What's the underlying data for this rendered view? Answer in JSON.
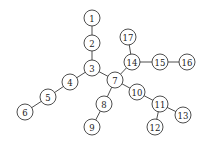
{
  "diagram": {
    "type": "tree-graph",
    "node_radius": 8,
    "colors": {
      "stroke": "#3a3a3a",
      "fill": "#ffffff",
      "text": "#222222",
      "background": "#ffffff"
    },
    "nodes": [
      {
        "id": "1",
        "label": "1",
        "x": 92,
        "y": 18
      },
      {
        "id": "2",
        "label": "2",
        "x": 92,
        "y": 43
      },
      {
        "id": "3",
        "label": "3",
        "x": 92,
        "y": 68
      },
      {
        "id": "4",
        "label": "4",
        "x": 70,
        "y": 82
      },
      {
        "id": "5",
        "label": "5",
        "x": 48,
        "y": 97
      },
      {
        "id": "6",
        "label": "6",
        "x": 25,
        "y": 112
      },
      {
        "id": "7",
        "label": "7",
        "x": 115,
        "y": 80
      },
      {
        "id": "8",
        "label": "8",
        "x": 104,
        "y": 104
      },
      {
        "id": "9",
        "label": "9",
        "x": 92,
        "y": 127
      },
      {
        "id": "10",
        "label": "10",
        "x": 137,
        "y": 92
      },
      {
        "id": "11",
        "label": "11",
        "x": 160,
        "y": 104
      },
      {
        "id": "12",
        "label": "12",
        "x": 155,
        "y": 127
      },
      {
        "id": "13",
        "label": "13",
        "x": 183,
        "y": 115
      },
      {
        "id": "14",
        "label": "14",
        "x": 132,
        "y": 62
      },
      {
        "id": "15",
        "label": "15",
        "x": 160,
        "y": 62
      },
      {
        "id": "16",
        "label": "16",
        "x": 187,
        "y": 62
      },
      {
        "id": "17",
        "label": "17",
        "x": 128,
        "y": 37
      }
    ],
    "edges": [
      [
        "1",
        "2"
      ],
      [
        "2",
        "3"
      ],
      [
        "3",
        "4"
      ],
      [
        "4",
        "5"
      ],
      [
        "5",
        "6"
      ],
      [
        "3",
        "7"
      ],
      [
        "7",
        "8"
      ],
      [
        "8",
        "9"
      ],
      [
        "7",
        "14"
      ],
      [
        "14",
        "17"
      ],
      [
        "14",
        "15"
      ],
      [
        "15",
        "16"
      ],
      [
        "7",
        "10"
      ],
      [
        "10",
        "11"
      ],
      [
        "11",
        "12"
      ],
      [
        "11",
        "13"
      ]
    ]
  }
}
